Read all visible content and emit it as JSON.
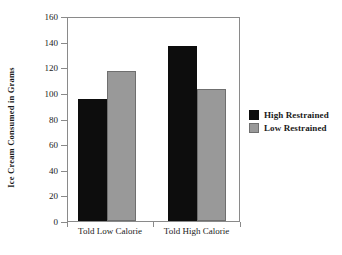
{
  "chart_data": {
    "type": "bar",
    "title": "",
    "subtitle": "",
    "xlabel": "",
    "ylabel": "Ice Cream Consumed in Grams",
    "categories": [
      "Told Low Calorie",
      "Told High Calorie"
    ],
    "series": [
      {
        "name": "High Restrained",
        "color": "#0d0d0d",
        "values": [
          96,
          138
        ]
      },
      {
        "name": "Low Restrained",
        "color": "#999999",
        "values": [
          118,
          104
        ]
      }
    ],
    "ylim": [
      0,
      160
    ],
    "ytick_step": 20,
    "yticks": [
      0,
      20,
      40,
      60,
      80,
      100,
      120,
      140,
      160
    ],
    "ytick_labels": [
      "0",
      "20",
      "40",
      "60",
      "80",
      "100",
      "120",
      "140",
      "160"
    ],
    "grid": false,
    "legend_position": "right",
    "legend_entries": [
      "High Restrained",
      "Low Restrained"
    ],
    "annotations": []
  }
}
